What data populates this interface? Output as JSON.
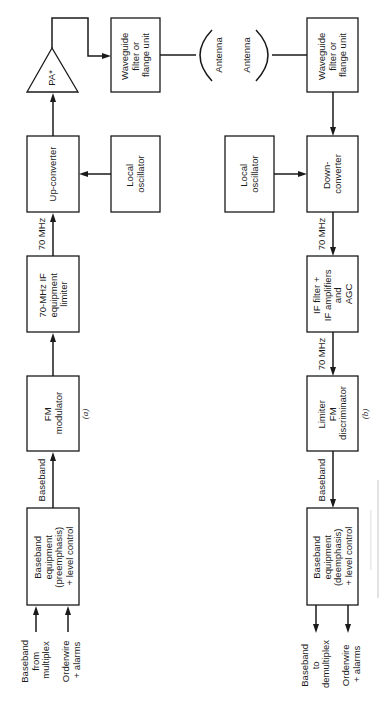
{
  "transmitter": {
    "caption": "(a)",
    "blocks": {
      "baseband_equipment": [
        "Baseband",
        "equipment",
        "(preemphasis)",
        "+ level control"
      ],
      "fm_modulator": [
        "FM",
        "modulator"
      ],
      "if_equipment": [
        "70-MHz IF",
        "equipment",
        "limiter"
      ],
      "up_converter": [
        "Up-converter"
      ],
      "local_oscillator": [
        "Local",
        "oscillator"
      ],
      "pa": [
        "PA*"
      ],
      "waveguide": [
        "Waveguide",
        "filter or",
        "flange unit"
      ],
      "antenna": [
        "Antenna"
      ]
    },
    "inputs": {
      "baseband_from_multiplex": [
        "Baseband",
        "from",
        "multiplex"
      ],
      "orderwire_alarms": [
        "Orderwire",
        "+ alarms"
      ]
    },
    "signal_labels": {
      "baseband": "Baseband",
      "if_70mhz": "70 MHz"
    }
  },
  "receiver": {
    "caption": "(b)",
    "blocks": {
      "antenna": [
        "Antenna"
      ],
      "waveguide": [
        "Waveguide",
        "filter or",
        "flange unit"
      ],
      "down_converter": [
        "Down-",
        "converter"
      ],
      "local_oscillator": [
        "Local",
        "oscillator"
      ],
      "if_filter": [
        "IF filter +",
        "IF amplifiers",
        "and",
        "AGC"
      ],
      "limiter_discriminator": [
        "Limiter",
        "FM",
        "discriminator"
      ],
      "baseband_equipment": [
        "Baseband",
        "equipment",
        "(deemphasis)",
        "+ level control"
      ]
    },
    "outputs": {
      "baseband_to_demultiplex": [
        "Baseband",
        "to",
        "demultiplex"
      ],
      "orderwire_alarms": [
        "Orderwire",
        "+ alarms"
      ]
    },
    "signal_labels": {
      "if_70mhz_a": "70 MHz",
      "if_70mhz_b": "70 MHz",
      "baseband": "Baseband"
    }
  }
}
